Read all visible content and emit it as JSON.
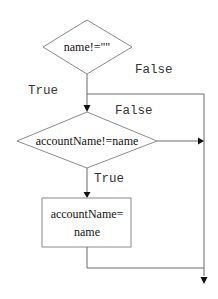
{
  "diagram": {
    "type": "flowchart",
    "nodes": [
      {
        "id": "decision-1",
        "shape": "diamond",
        "label": "name!=\"\""
      },
      {
        "id": "decision-2",
        "shape": "diamond",
        "label": "accountName!=name"
      },
      {
        "id": "process-1",
        "shape": "rectangle",
        "label_line1": "accountName=",
        "label_line2": "name"
      }
    ],
    "edges": [
      {
        "from": "decision-1",
        "to": "decision-2",
        "label": "True"
      },
      {
        "from": "decision-1",
        "to": "exit",
        "label": "False"
      },
      {
        "from": "decision-2",
        "to": "process-1",
        "label": "True"
      },
      {
        "from": "decision-2",
        "to": "exit",
        "label": "False"
      },
      {
        "from": "process-1",
        "to": "exit",
        "label": ""
      }
    ],
    "colors": {
      "stroke": "#8a8a8a",
      "text": "#111111",
      "label": "#333333",
      "background": "#ffffff"
    }
  }
}
